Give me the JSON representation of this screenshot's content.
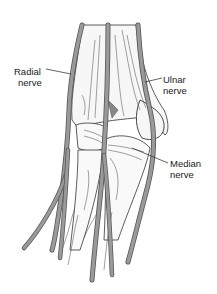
{
  "figure": {
    "colors": {
      "background": "#ffffff",
      "nerve_fill": "#9a9a9a",
      "nerve_outline": "#555555",
      "bone_fill": "#f7f7f7",
      "line_art": "#333333",
      "label_text": "#222222"
    }
  },
  "labels": {
    "radial": {
      "line1": "Radial",
      "line2": "nerve"
    },
    "ulnar": {
      "line1": "Ulnar",
      "line2": "nerve"
    },
    "median": {
      "line1": "Median",
      "line2": "nerve"
    }
  }
}
